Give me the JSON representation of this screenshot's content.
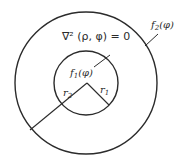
{
  "figure": {
    "width": 183,
    "height": 166,
    "ink_color": "#2b2b2b",
    "background": "#ffffff"
  },
  "outer_circle": {
    "cx": 86,
    "cy": 83,
    "r": 71,
    "stroke_width": 1.4
  },
  "inner_circle": {
    "cx": 86,
    "cy": 83,
    "r": 32,
    "stroke_width": 1.4
  },
  "lines": {
    "r1_radius": {
      "x1": 87,
      "y1": 83,
      "x2": 109,
      "y2": 105
    },
    "r2_radius": {
      "x1": 87,
      "y1": 83,
      "x2": 30,
      "y2": 130
    },
    "f1_leader": {
      "x1": 94,
      "y1": 67,
      "x2": 110,
      "y2": 55
    },
    "f2_leader": {
      "x1": 145,
      "y1": 46,
      "x2": 158,
      "y2": 34
    }
  },
  "labels": {
    "equation": "∇² (ρ, φ) = 0",
    "f1": {
      "base": "f",
      "sub": "1",
      "arg": "(φ)"
    },
    "f2": {
      "base": "f",
      "sub": "2",
      "arg": "(φ)"
    },
    "r1": {
      "base": "r",
      "sub": "1"
    },
    "r2": {
      "base": "r",
      "sub": "2"
    }
  }
}
